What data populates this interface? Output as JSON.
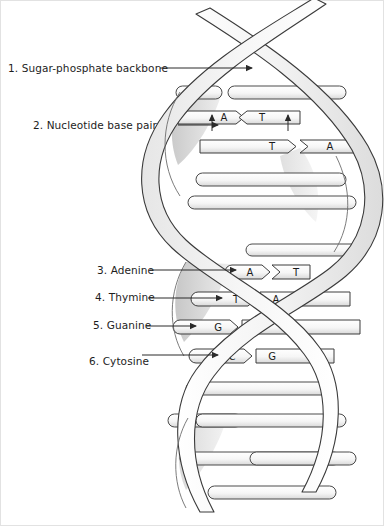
{
  "diagram": {
    "style": {
      "line_color": "#333333",
      "ribbon_fill": "#f2f2f2",
      "ribbon_shade": "#d8d8d8",
      "ribbon_dark": "#c0c0c0",
      "rung_fill": "#f7f7f7",
      "background": "#ffffff",
      "text_color": "#1d1d1d"
    }
  },
  "labels": [
    {
      "id": "1",
      "text": "1. Sugar-phosphate backbone",
      "number": 1,
      "target": "backbone-ribbon"
    },
    {
      "id": "2",
      "text": "2. Nucleotide base pair",
      "number": 2,
      "target": "base-pair-a-t"
    },
    {
      "id": "3",
      "text": "3. Adenine",
      "number": 3,
      "target": "base-adenine"
    },
    {
      "id": "4",
      "text": "4. Thymine",
      "number": 4,
      "target": "base-thymine"
    },
    {
      "id": "5",
      "text": "5. Guanine",
      "number": 5,
      "target": "base-guanine"
    },
    {
      "id": "6",
      "text": "6. Cytosine",
      "number": 6,
      "target": "base-cytosine"
    }
  ],
  "base_pairs": [
    {
      "left": "A",
      "right": "T",
      "y": 117,
      "labelled": true,
      "label_ref": "2"
    },
    {
      "left": "T",
      "right": "A",
      "y": 146,
      "labelled": false
    },
    {
      "left": "A",
      "right": "T",
      "y": 272,
      "labelled": true,
      "label_ref": "3"
    },
    {
      "left": "T",
      "right": "A",
      "y": 299,
      "labelled": true,
      "label_ref": "4"
    },
    {
      "left": "G",
      "right": "C",
      "y": 327,
      "labelled": true,
      "label_ref": "5"
    },
    {
      "left": "C",
      "right": "G",
      "y": 356,
      "labelled": true,
      "label_ref": "6"
    }
  ],
  "base_letters": {
    "adenine": "A",
    "thymine": "T",
    "guanine": "G",
    "cytosine": "C"
  }
}
